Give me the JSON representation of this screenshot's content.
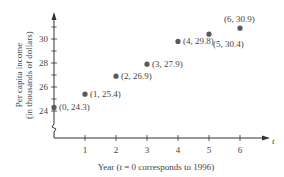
{
  "chart_data": {
    "type": "scatter",
    "title": "",
    "xlabel": "Year (t = 0 corresponds to 1996)",
    "xlabel_parts": {
      "pre": "Year (",
      "var": "t",
      "post": " = 0 corresponds to 1996)"
    },
    "ylabel_line1": "Per capita income",
    "ylabel_line2": "(in thousands of dollars)",
    "x_axis_var": "t",
    "xlim": [
      0,
      6.8
    ],
    "ylim": [
      23,
      31.5
    ],
    "y_axis_break": true,
    "grid": false,
    "x_ticks": [
      1,
      2,
      3,
      4,
      5,
      6
    ],
    "y_ticks": [
      24,
      26,
      28,
      30
    ],
    "y_minor_ticks": [
      25,
      27,
      29,
      31
    ],
    "points": [
      {
        "x": 0,
        "y": 24.3,
        "label": "(0, 24.3)",
        "label_pos": "right"
      },
      {
        "x": 1,
        "y": 25.4,
        "label": "(1, 25.4)",
        "label_pos": "right"
      },
      {
        "x": 2,
        "y": 26.9,
        "label": "(2, 26.9)",
        "label_pos": "right"
      },
      {
        "x": 3,
        "y": 27.9,
        "label": "(3, 27.9)",
        "label_pos": "right"
      },
      {
        "x": 4,
        "y": 29.8,
        "label": "(4, 29.8)",
        "label_pos": "right"
      },
      {
        "x": 5,
        "y": 30.4,
        "label": "(5, 30.4)",
        "label_pos": "below"
      },
      {
        "x": 6,
        "y": 30.9,
        "label": "(6, 30.9)",
        "label_pos": "above"
      }
    ],
    "colors": {
      "point": "#5a5a5a",
      "axis": "#333333",
      "text": "#444444"
    }
  }
}
